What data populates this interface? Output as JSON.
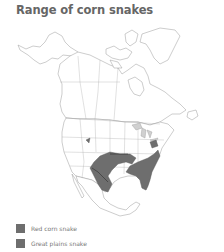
{
  "title": "Range of corn snakes",
  "colors": {
    "outline": "#9a9a9a",
    "land": "#ffffff",
    "range_fill": "#6e6e6e",
    "range_border": "#333333",
    "title": "#666666",
    "legend_text": "#777777"
  },
  "legend": {
    "items": [
      {
        "label": "Red corn snake",
        "color": "#6e6e6e"
      },
      {
        "label": "Great plains snake",
        "color": "#6e6e6e"
      }
    ]
  }
}
